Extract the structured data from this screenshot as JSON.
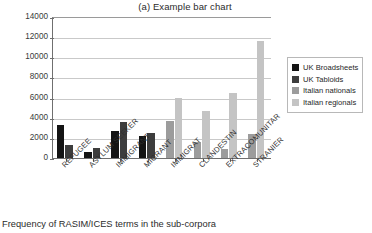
{
  "chart_data": {
    "type": "bar",
    "title": "(a) Example bar chart",
    "caption": "Frequency of RASIM/ICES terms in the sub-corpora",
    "xlabel": "",
    "ylabel": "Frequency of lemma (raw)",
    "ylim": [
      0,
      14000
    ],
    "ytick_labels": [
      "14000",
      "12000",
      "10000",
      "8000",
      "6000",
      "4000",
      "2000",
      "0"
    ],
    "ytick_values": [
      14000,
      12000,
      10000,
      8000,
      6000,
      4000,
      2000,
      0
    ],
    "grid": true,
    "legend_position": "right",
    "categories": [
      "REFUGEE",
      "ASYLUM SEEKER",
      "IMMIGRANT",
      "MIGRANT",
      "IMMIGRAT",
      "CLANDESTIN",
      "EXTRACOMUNITAR",
      "STRANIER"
    ],
    "series": [
      {
        "name": "UK Broadsheets",
        "color": "#141414",
        "values": [
          3300,
          570,
          2700,
          2150,
          null,
          null,
          null,
          null
        ]
      },
      {
        "name": "UK Tabloids",
        "color": "#3d3d3d",
        "values": [
          1250,
          950,
          3550,
          2500,
          null,
          null,
          null,
          null
        ]
      },
      {
        "name": "Italian nationals",
        "color": "#9c9c9c",
        "values": [
          null,
          null,
          null,
          null,
          3650,
          1550,
          900,
          2350
        ]
      },
      {
        "name": "Italian regionals",
        "color": "#c4c4c4",
        "values": [
          null,
          null,
          null,
          null,
          6000,
          4650,
          6500,
          11600
        ]
      }
    ]
  },
  "legend": {
    "items": [
      {
        "label": "UK Broadsheets",
        "color": "#141414"
      },
      {
        "label": "UK Tabloids",
        "color": "#3d3d3d"
      },
      {
        "label": "Italian nationals",
        "color": "#9c9c9c"
      },
      {
        "label": "Italian regionals",
        "color": "#c4c4c4"
      }
    ]
  }
}
